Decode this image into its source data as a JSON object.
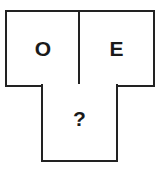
{
  "diagram": {
    "type": "letter-puzzle",
    "cells": [
      {
        "position": "top-left",
        "label": "O"
      },
      {
        "position": "top-right",
        "label": "E"
      },
      {
        "position": "bottom-center",
        "label": "?"
      }
    ],
    "border_color": "#222222",
    "text_color": "#1a1a1a",
    "background": "#ffffff"
  }
}
